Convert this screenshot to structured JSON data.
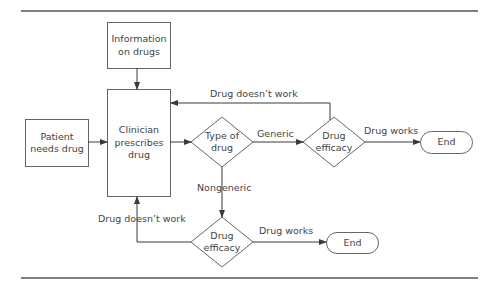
{
  "diagram": {
    "type": "flowchart",
    "colors": {
      "line": "#3a3a3a",
      "text": "#444444",
      "background": "#ffffff"
    },
    "nodes": {
      "info": {
        "shape": "rect",
        "line1": "Information",
        "line2": "on drugs"
      },
      "clinician": {
        "shape": "rect",
        "line1": "Clinician",
        "line2": "prescribes",
        "line3": "drug"
      },
      "patient": {
        "shape": "rect",
        "line1": "Patient",
        "line2": "needs drug"
      },
      "type_of_drug": {
        "shape": "diamond",
        "line1": "Type of",
        "line2": "drug"
      },
      "efficacy_generic": {
        "shape": "diamond",
        "line1": "Drug",
        "line2": "efficacy"
      },
      "end_generic": {
        "shape": "terminator",
        "label": "End"
      },
      "efficacy_nongeneric": {
        "shape": "diamond",
        "line1": "Drug",
        "line2": "efficacy"
      },
      "end_nongeneric": {
        "shape": "terminator",
        "label": "End"
      }
    },
    "edges": {
      "generic": "Generic",
      "nongeneric": "Nongeneric",
      "works_top": "Drug works",
      "doesnt_work_top": "Drug doesn’t work",
      "works_bottom": "Drug works",
      "doesnt_work_bottom": "Drug doesn’t work"
    }
  }
}
